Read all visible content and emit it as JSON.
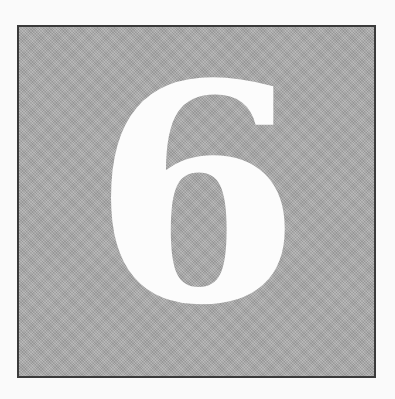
{
  "chapter": {
    "number": "6",
    "box_fill_color": "#a9a9a9",
    "box_border_color": "#3a3a3a",
    "numeral_color": "#fcfcfc"
  }
}
